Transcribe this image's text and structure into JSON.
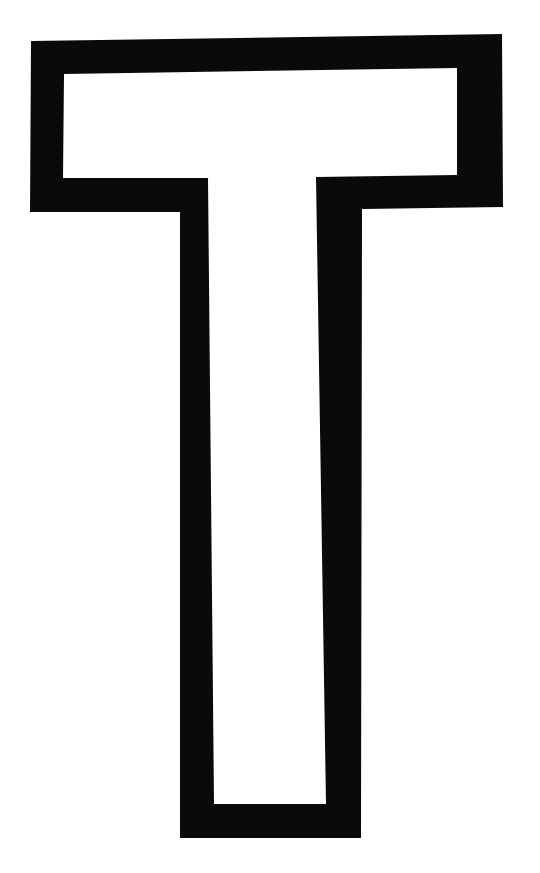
{
  "figure": {
    "letter": "T",
    "fill_color": "#ffffff",
    "stroke_color": "#0a0a0a",
    "background": "#ffffff",
    "outer_outline": [
      [
        31,
        41
      ],
      [
        502,
        34
      ],
      [
        503,
        207
      ],
      [
        362,
        209
      ],
      [
        361,
        838
      ],
      [
        180,
        838
      ],
      [
        180,
        212
      ],
      [
        30,
        212
      ]
    ],
    "inner_outline": [
      [
        64,
        74
      ],
      [
        457,
        68
      ],
      [
        457,
        175
      ],
      [
        316,
        177
      ],
      [
        326,
        804
      ],
      [
        214,
        804
      ],
      [
        208,
        178
      ],
      [
        63,
        178
      ]
    ]
  }
}
